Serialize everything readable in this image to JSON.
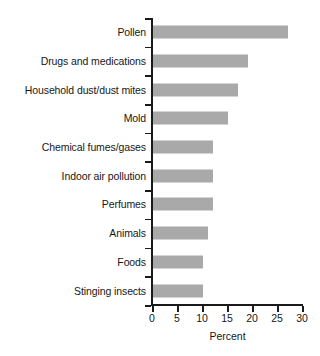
{
  "chart_data": {
    "type": "bar",
    "orientation": "horizontal",
    "title": "",
    "subtitle": "",
    "xlabel": "Percent",
    "ylabel": "",
    "xlim": [
      0,
      30
    ],
    "ylim": null,
    "grid": false,
    "legend": null,
    "bar_color": "#a9a9a9",
    "axis_color": "#1a1a1a",
    "text_color": "#171717",
    "xticks": [
      0,
      5,
      10,
      15,
      20,
      25,
      30
    ],
    "xtick_labels": [
      "0",
      "5",
      "10",
      "15",
      "20",
      "25",
      "30"
    ],
    "categories": [
      "Pollen",
      "Drugs and medications",
      "Household dust/dust mites",
      "Mold",
      "Chemical fumes/gases",
      "Indoor air pollution",
      "Perfumes",
      "Animals",
      "Foods",
      "Stinging insects"
    ],
    "values": [
      27,
      19,
      17,
      15,
      12,
      12,
      12,
      11,
      10,
      10
    ],
    "value_unit": "percent",
    "points": [
      {
        "category": "Pollen",
        "value": 27
      },
      {
        "category": "Drugs and medications",
        "value": 19
      },
      {
        "category": "Household dust/dust mites",
        "value": 17
      },
      {
        "category": "Mold",
        "value": 15
      },
      {
        "category": "Chemical fumes/gases",
        "value": 12
      },
      {
        "category": "Indoor air pollution",
        "value": 12
      },
      {
        "category": "Perfumes",
        "value": 12
      },
      {
        "category": "Animals",
        "value": 11
      },
      {
        "category": "Foods",
        "value": 10
      },
      {
        "category": "Stinging insects",
        "value": 10
      }
    ]
  }
}
